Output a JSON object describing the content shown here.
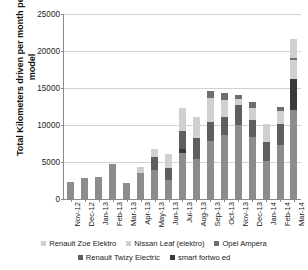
{
  "chart_data": {
    "type": "bar",
    "subtype": "stacked-vertical-bar",
    "title": "",
    "xlabel": "",
    "ylabel": "Total Kilometers driven per month per car model",
    "ylim": [
      0,
      25000
    ],
    "ytick_step": 5000,
    "ytick_labels": [
      "0",
      "5000",
      "10000",
      "15000",
      "20000",
      "25000"
    ],
    "ytick_values": [
      0,
      5000,
      10000,
      15000,
      20000,
      25000
    ],
    "grid": true,
    "grid_axis": "y",
    "legend_position": "bottom",
    "categories": [
      "Nov-12",
      "Dec-12",
      "Jan-13",
      "Feb-13",
      "Mar-13",
      "Apr-13",
      "May-13",
      "Jun-13",
      "Jul-13",
      "Aug-13",
      "Sep-13",
      "Oct-13",
      "Nov-13",
      "Dec-13",
      "Jan-14",
      "Feb-14",
      "Mar-14"
    ],
    "series": [
      {
        "name": "Renault Zoe Elektro",
        "color": "#8c8c8c",
        "values": [
          2300,
          2800,
          2900,
          4700,
          2150,
          3500,
          3900,
          2500,
          6200,
          5400,
          7800,
          8600,
          9900,
          8300,
          5100,
          7300,
          12000
        ]
      },
      {
        "name": "smart fortwo ed",
        "color": "#3a3a3a",
        "values": [
          0,
          0,
          0,
          0,
          0,
          0,
          0,
          0,
          500,
          0,
          0,
          0,
          0,
          0,
          0,
          0,
          4200
        ]
      },
      {
        "name": "Renault Twizy Electric",
        "color": "#5e5e5e",
        "values": [
          0,
          0,
          0,
          0,
          0,
          0,
          1700,
          1700,
          2400,
          2800,
          2600,
          2400,
          2800,
          2300,
          2600,
          2800,
          0
        ]
      },
      {
        "name": "Nissan Leaf (elektro)",
        "color": "#d0d0d0",
        "values": [
          0,
          0,
          0,
          0,
          0,
          750,
          1100,
          1900,
          3100,
          2800,
          3200,
          2300,
          700,
          1700,
          2400,
          1700,
          2500
        ]
      },
      {
        "name": "Opel Ampera",
        "color": "#6e6e6e",
        "values": [
          0,
          0,
          0,
          0,
          0,
          0,
          0,
          0,
          0,
          0,
          900,
          900,
          600,
          700,
          0,
          600,
          300
        ]
      },
      {
        "name": "Renault Zoe Elektro (top)",
        "color": "#d0d0d0",
        "values": [
          0,
          0,
          0,
          0,
          0,
          0,
          0,
          0,
          0,
          0,
          0,
          0,
          0,
          0,
          0,
          0,
          2500
        ]
      }
    ],
    "totals": [
      2300,
      2800,
      2900,
      4700,
      2150,
      4250,
      6700,
      6100,
      12200,
      11000,
      14500,
      14200,
      14000,
      13000,
      10100,
      12400,
      21500
    ],
    "annotations": []
  },
  "axis": {
    "y_title": "Total Kilometers driven per month per car model",
    "y_ticks": [
      {
        "label": "25000",
        "value": 25000
      },
      {
        "label": "20000",
        "value": 20000
      },
      {
        "label": "15000",
        "value": 15000
      },
      {
        "label": "10000",
        "value": 10000
      },
      {
        "label": "5000",
        "value": 5000
      },
      {
        "label": "0",
        "value": 0
      }
    ]
  },
  "legend": {
    "row1": [
      {
        "label": "Renault Zoe Elektro",
        "color": "#d0d0d0"
      },
      {
        "label": "Nissan Leaf (elektro)",
        "color": "#d0d0d0"
      },
      {
        "label": "Opel Ampera",
        "color": "#6e6e6e"
      }
    ],
    "row2": [
      {
        "label": "Renault Twizy Electric",
        "color": "#5e5e5e"
      },
      {
        "label": "smart fortwo ed",
        "color": "#3a3a3a"
      }
    ]
  },
  "colors": {
    "axis": "#8a8a8a",
    "grid": "#d2d2d2",
    "background": "#ffffff",
    "text": "#222222"
  }
}
